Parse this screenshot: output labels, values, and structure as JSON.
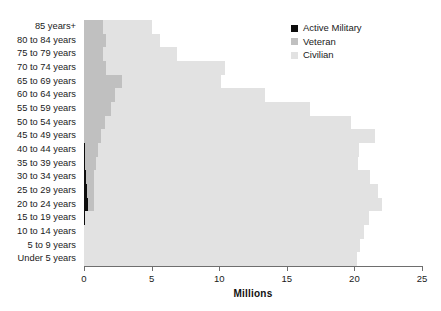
{
  "chart_data": {
    "type": "bar",
    "orientation": "horizontal",
    "stacked": true,
    "title": "",
    "xlabel": "Millions",
    "ylabel": "",
    "xlim": [
      0,
      25
    ],
    "xticks": [
      0,
      5,
      10,
      15,
      20,
      25
    ],
    "xtick_labels": [
      "0",
      "5",
      "10",
      "15",
      "20",
      "25"
    ],
    "grid": false,
    "legend_position": "top-right",
    "categories": [
      "85 years+",
      "80 to 84 years",
      "75 to 79 years",
      "70 to 74 years",
      "65 to 69 years",
      "60 to 64 years",
      "55 to 59 years",
      "50 to 54 years",
      "45 to 49 years",
      "40 to 44 years",
      "35 to 39 years",
      "30 to 34 years",
      "25 to 29 years",
      "20 to 24 years",
      "15 to 19 years",
      "10 to 14 years",
      "5 to 9 years",
      "Under 5 years"
    ],
    "series": [
      {
        "name": "Active Military",
        "color": "#0d0d0d",
        "values": [
          0,
          0,
          0,
          0,
          0,
          0,
          0,
          0.02,
          0.03,
          0.05,
          0.07,
          0.12,
          0.22,
          0.32,
          0.05,
          0,
          0,
          0
        ]
      },
      {
        "name": "Veteran",
        "color": "#c0c0c0",
        "values": [
          1.4,
          1.6,
          1.4,
          1.6,
          2.8,
          2.3,
          2.0,
          1.5,
          1.2,
          1.0,
          0.8,
          0.6,
          0.5,
          0.4,
          0.0,
          0,
          0,
          0
        ]
      },
      {
        "name": "Civilian",
        "color": "#e2e2e2",
        "values": [
          3.6,
          4.0,
          5.5,
          8.8,
          7.3,
          11.1,
          14.7,
          18.2,
          20.3,
          19.3,
          19.4,
          20.4,
          21.0,
          21.3,
          21.0,
          20.7,
          20.4,
          20.2
        ]
      }
    ],
    "legend": [
      {
        "label": "Active Military",
        "swatch": "#0d0d0d"
      },
      {
        "label": "Veteran",
        "swatch": "#c0c0c0"
      },
      {
        "label": "Civilian",
        "swatch": "#e2e2e2"
      }
    ]
  }
}
